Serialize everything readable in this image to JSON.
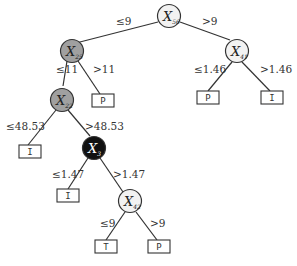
{
  "diagram": {
    "type": "decision-tree",
    "colors": {
      "white_node": "#f2f2f2",
      "gray_node": "#a0a0a0",
      "black_node": "#111111",
      "line": "#333333"
    },
    "nodes": [
      {
        "id": "n56",
        "var": "X",
        "sub": "56",
        "fill": "white"
      },
      {
        "id": "n25",
        "var": "X",
        "sub": "25",
        "fill": "gray"
      },
      {
        "id": "n41",
        "var": "X",
        "sub": "41",
        "fill": "white"
      },
      {
        "id": "n22",
        "var": "X",
        "sub": "22",
        "fill": "gray"
      },
      {
        "id": "n3",
        "var": "X",
        "sub": "3",
        "fill": "black"
      },
      {
        "id": "n42",
        "var": "X",
        "sub": "42",
        "fill": "white"
      }
    ],
    "leaves": [
      {
        "id": "l1",
        "label": "P"
      },
      {
        "id": "l2",
        "label": "P"
      },
      {
        "id": "l3",
        "label": "I"
      },
      {
        "id": "l4",
        "label": "I"
      },
      {
        "id": "l5",
        "label": "I"
      },
      {
        "id": "l6",
        "label": "T"
      },
      {
        "id": "l7",
        "label": "P"
      }
    ],
    "edges": [
      {
        "from": "n56",
        "to": "n25",
        "label": "≤9"
      },
      {
        "from": "n56",
        "to": "n41",
        "label": ">9"
      },
      {
        "from": "n25",
        "to": "n22",
        "label": "≤11"
      },
      {
        "from": "n25",
        "to": "l1",
        "label": ">11"
      },
      {
        "from": "n41",
        "to": "l2",
        "label": "≤1.46"
      },
      {
        "from": "n41",
        "to": "l3",
        "label": ">1.46"
      },
      {
        "from": "n22",
        "to": "l4",
        "label": "≤48.53"
      },
      {
        "from": "n22",
        "to": "n3",
        "label": ">48.53"
      },
      {
        "from": "n3",
        "to": "l5",
        "label": "≤1.47"
      },
      {
        "from": "n3",
        "to": "n42",
        "label": ">1.47"
      },
      {
        "from": "n42",
        "to": "l6",
        "label": "≤9"
      },
      {
        "from": "n42",
        "to": "l7",
        "label": ">9"
      }
    ]
  }
}
